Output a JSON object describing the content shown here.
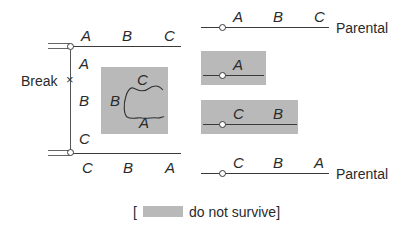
{
  "left_diagram": {
    "top_row_labels": [
      "A",
      "B",
      "C"
    ],
    "bottom_row_labels": [
      "C",
      "B",
      "A"
    ],
    "vertical_labels": [
      "A",
      "B",
      "C"
    ],
    "break_label": "Break",
    "break_marker": "×",
    "loop_labels": {
      "top": "C",
      "left": "B",
      "bottom": "A"
    }
  },
  "right_diagram": {
    "parental_top": {
      "labels": [
        "A",
        "B",
        "C"
      ],
      "caption": "Parental"
    },
    "fragment_1": {
      "labels": [
        "A"
      ]
    },
    "fragment_2": {
      "labels": [
        "C",
        "B"
      ]
    },
    "parental_bottom": {
      "labels": [
        "C",
        "B",
        "A"
      ],
      "caption": "Parental"
    }
  },
  "legend": {
    "open_bracket": "[",
    "text": "do not survive]"
  },
  "colors": {
    "shade": "#b9b9b9",
    "line": "#3a3a3a"
  }
}
